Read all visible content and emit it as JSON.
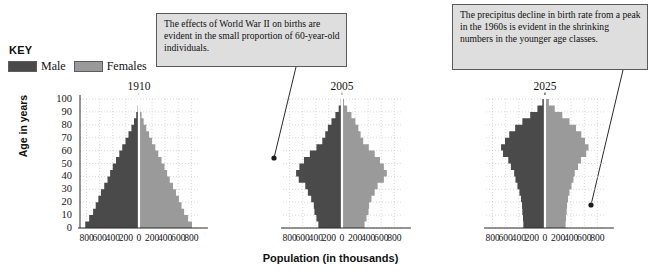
{
  "key": {
    "title": "KEY",
    "items": [
      {
        "label": "Male",
        "color": "#4a4a4a"
      },
      {
        "label": "Females",
        "color": "#9a9a9a"
      }
    ]
  },
  "callouts": [
    {
      "id": "ww2",
      "text": "The effects of World War II on births are evident in the small proportion of 60-year-old individuals."
    },
    {
      "id": "birthrate",
      "text": "The precipitus decline in birth rate from a peak in the 1960s is evident in the shrinking numbers in the younger age classes."
    }
  ],
  "axes": {
    "ylabel": "Age in years",
    "xlabel": "Population (in thousands)",
    "yticks": [
      "0",
      "10",
      "20",
      "30",
      "40",
      "50",
      "60",
      "70",
      "80",
      "90",
      "100"
    ],
    "xticks": [
      "800",
      "600",
      "400",
      "200",
      "0",
      "200",
      "400",
      "600",
      "800"
    ]
  },
  "chart_data": {
    "type": "bar",
    "subtitle": "",
    "xlabel": "Population (in thousands)",
    "ylabel": "Age in years",
    "orientation": "horizontal-back-to-back",
    "grid": true,
    "legend_position": "top-left",
    "xlim": [
      -900,
      900
    ],
    "ylim": [
      0,
      100
    ],
    "xtick_values": [
      -800,
      -600,
      -400,
      -200,
      0,
      200,
      400,
      600,
      800
    ],
    "ytick_values": [
      0,
      10,
      20,
      30,
      40,
      50,
      60,
      70,
      80,
      90,
      100
    ],
    "age_classes": [
      0,
      5,
      10,
      15,
      20,
      25,
      30,
      35,
      40,
      45,
      50,
      55,
      60,
      65,
      70,
      75,
      80,
      85,
      90,
      95,
      100
    ],
    "legend": [
      {
        "name": "Male",
        "color": "#4a4a4a"
      },
      {
        "name": "Females",
        "color": "#9a9a9a"
      }
    ],
    "panels": [
      {
        "year": "1910",
        "series": [
          {
            "name": "Male",
            "values": [
              820,
              760,
              700,
              660,
              620,
              580,
              530,
              480,
              440,
              400,
              350,
              300,
              255,
              205,
              160,
              115,
              75,
              42,
              20,
              8,
              2
            ]
          },
          {
            "name": "Females",
            "values": [
              810,
              750,
              690,
              650,
              610,
              565,
              520,
              470,
              430,
              390,
              345,
              295,
              250,
              200,
              155,
              112,
              72,
              40,
              18,
              7,
              2
            ]
          }
        ]
      },
      {
        "year": "2005",
        "series": [
          {
            "name": "Male",
            "values": [
              360,
              390,
              420,
              430,
              470,
              520,
              560,
              660,
              700,
              650,
              580,
              490,
              390,
              300,
              255,
              215,
              160,
              100,
              50,
              18,
              5
            ]
          },
          {
            "name": "Females",
            "values": [
              345,
              375,
              405,
              415,
              450,
              500,
              545,
              640,
              685,
              640,
              580,
              500,
              410,
              325,
              285,
              250,
              205,
              145,
              80,
              32,
              9
            ]
          }
        ]
      },
      {
        "year": "2025",
        "series": [
          {
            "name": "Male",
            "values": [
              330,
              335,
              345,
              350,
              365,
              390,
              420,
              450,
              470,
              520,
              560,
              640,
              670,
              610,
              545,
              455,
              345,
              225,
              115,
              40,
              10
            ]
          },
          {
            "name": "Females",
            "values": [
              315,
              322,
              332,
              338,
              352,
              375,
              405,
              435,
              455,
              505,
              550,
              630,
              665,
              612,
              555,
              475,
              375,
              265,
              150,
              60,
              16
            ]
          }
        ]
      }
    ]
  }
}
